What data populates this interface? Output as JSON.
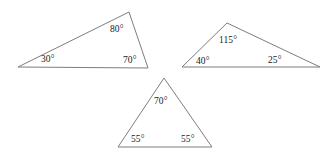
{
  "figure": {
    "background_color": "#ffffff",
    "stroke_color": "#7d7d7d",
    "text_color": "#1a1a1a",
    "stroke_width": 1,
    "width": 325,
    "height": 156
  },
  "triangles": [
    {
      "name": "scalene-triangle-left",
      "points": "18,67 129,12 148,68",
      "angles": [
        {
          "label": "30°",
          "value": 30,
          "x": 41,
          "y": 55,
          "vertex": "bottom-left"
        },
        {
          "label": "80°",
          "value": 80,
          "x": 110,
          "y": 25,
          "vertex": "apex"
        },
        {
          "label": "70°",
          "value": 70,
          "x": 123,
          "y": 56,
          "vertex": "bottom-right"
        }
      ]
    },
    {
      "name": "obtuse-triangle-right",
      "points": "182,67 227,23 320,67",
      "angles": [
        {
          "label": "115°",
          "value": 115,
          "x": 219,
          "y": 36,
          "vertex": "apex"
        },
        {
          "label": "40°",
          "value": 40,
          "x": 196,
          "y": 57,
          "vertex": "bottom-left"
        },
        {
          "label": "25°",
          "value": 25,
          "x": 268,
          "y": 56,
          "vertex": "bottom-right"
        }
      ]
    },
    {
      "name": "isosceles-triangle-bottom",
      "points": "164,78 212,147 118,147",
      "angles": [
        {
          "label": "70°",
          "value": 70,
          "x": 154,
          "y": 97,
          "vertex": "apex"
        },
        {
          "label": "55°",
          "value": 55,
          "x": 131,
          "y": 135,
          "vertex": "bottom-left"
        },
        {
          "label": "55°",
          "value": 55,
          "x": 181,
          "y": 135,
          "vertex": "bottom-right"
        }
      ]
    }
  ]
}
